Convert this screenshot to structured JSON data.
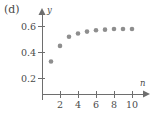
{
  "panel": {
    "label": "(d)"
  },
  "chart_data": {
    "type": "scatter",
    "title": "",
    "subtitle": "",
    "panel_label": "(d)",
    "xlabel": "n",
    "ylabel": "y",
    "x": [
      1,
      2,
      3,
      4,
      5,
      6,
      7,
      8,
      9,
      10
    ],
    "values": [
      0.25,
      0.37,
      0.44,
      0.465,
      0.48,
      0.49,
      0.495,
      0.5,
      0.5,
      0.5
    ],
    "series": [
      {
        "name": "",
        "x": [
          1,
          2,
          3,
          4,
          5,
          6,
          7,
          8,
          9,
          10
        ],
        "values": [
          0.25,
          0.37,
          0.44,
          0.465,
          0.48,
          0.49,
          0.495,
          0.5,
          0.5,
          0.5
        ]
      }
    ],
    "xlim": [
      0,
      11.6
    ],
    "ylim": [
      0,
      0.68
    ],
    "xticks": [
      2,
      4,
      6,
      8,
      10
    ],
    "xticklabels": [
      "2",
      "4",
      "6",
      "8",
      "10"
    ],
    "yticks": [
      0.2,
      0.4,
      0.6
    ],
    "yticklabels": [
      "0.2",
      "0.4",
      "0.6"
    ],
    "grid": false,
    "legend": null,
    "marker": "circle",
    "marker_color": "#8e8e8e",
    "axis_color": "#6e6e6e",
    "annotations": []
  }
}
